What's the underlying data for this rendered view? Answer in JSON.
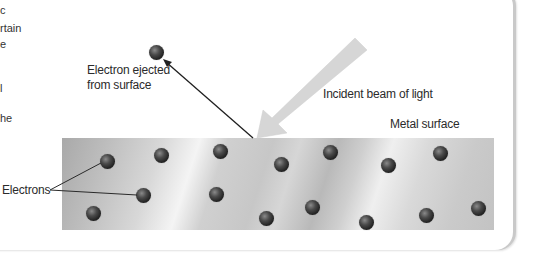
{
  "figure": {
    "left_column_fragments": [
      {
        "text": "c",
        "y": 4
      },
      {
        "text": "rtain",
        "y": 22
      },
      {
        "text": "e",
        "y": 38
      },
      {
        "text": "l",
        "y": 82
      },
      {
        "text": "he",
        "y": 112
      }
    ],
    "labels": {
      "ejected_line1": "Electron ejected",
      "ejected_line2": "from surface",
      "incident_beam": "Incident beam of light",
      "metal_surface": "Metal surface",
      "electrons": "Electrons"
    },
    "colors": {
      "beam": "#d6d6d6",
      "electron": "#333333",
      "arrow": "#1f1f1f",
      "metal_base": "#c6c6c6"
    },
    "ejected_electron": {
      "x": 156,
      "y": 52
    },
    "surface_electrons": [
      {
        "x": 107,
        "y": 161
      },
      {
        "x": 161,
        "y": 155
      },
      {
        "x": 143,
        "y": 195
      },
      {
        "x": 93,
        "y": 213
      },
      {
        "x": 220,
        "y": 151
      },
      {
        "x": 216,
        "y": 194
      },
      {
        "x": 266,
        "y": 218
      },
      {
        "x": 281,
        "y": 164
      },
      {
        "x": 330,
        "y": 152
      },
      {
        "x": 312,
        "y": 207
      },
      {
        "x": 388,
        "y": 165
      },
      {
        "x": 440,
        "y": 153
      },
      {
        "x": 366,
        "y": 222
      },
      {
        "x": 426,
        "y": 215
      },
      {
        "x": 478,
        "y": 208
      }
    ]
  }
}
